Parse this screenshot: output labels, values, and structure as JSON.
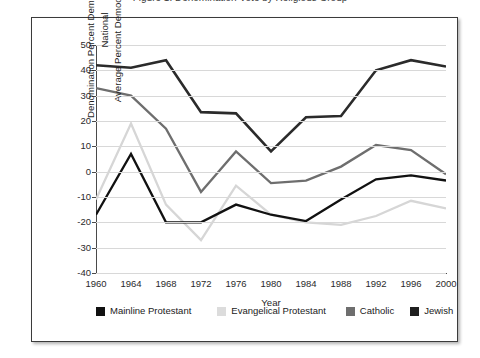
{
  "figure": {
    "title": "Figure 1. Denomination Vote by Religious Group",
    "frame_border_color": "#3b3b3b"
  },
  "chart_data": {
    "type": "line",
    "title": "Figure 1. Denomination Vote by Religious Group",
    "xlabel": "Year",
    "ylabel": "Denomination Percent Democratic Vote –National Average Percent Democratic Vote",
    "ylabel_line1": "Denomination Percent Democratic Vote –National",
    "ylabel_line2": "Average Percent Democratic Vote",
    "x": [
      1960,
      1964,
      1968,
      1972,
      1976,
      1980,
      1984,
      1988,
      1992,
      1996,
      2000
    ],
    "categories": [
      "1960",
      "1964",
      "1968",
      "1972",
      "1976",
      "1980",
      "1984",
      "1988",
      "1992",
      "1996",
      "2000"
    ],
    "ylim": [
      -40,
      50
    ],
    "yticks": [
      50,
      40,
      30,
      20,
      10,
      0,
      -10,
      -20,
      -30,
      -40
    ],
    "ytick_labels": [
      "50",
      "40",
      "30",
      "20",
      "10",
      "0",
      "-10",
      "-20",
      "-30",
      "-40"
    ],
    "grid": true,
    "legend_position": "bottom",
    "series": [
      {
        "name": "Mainline Protestant",
        "color": "#111111",
        "width": 2.3,
        "values": [
          -17,
          7,
          -20,
          -20,
          -13,
          -17,
          -19.5,
          -11,
          -3,
          -1.5,
          -3.5
        ]
      },
      {
        "name": "Evangelical Protestant",
        "color": "#d6d6d6",
        "width": 2.3,
        "values": [
          -11,
          19,
          -13,
          -27,
          -5.5,
          -17,
          -20,
          -21,
          -17.5,
          -11.5,
          -14.5
        ]
      },
      {
        "name": "Catholic",
        "color": "#6e6e6e",
        "width": 2.3,
        "values": [
          33,
          30,
          17,
          -8,
          8,
          -4.5,
          -3.5,
          2,
          10.5,
          8.5,
          -1
        ]
      },
      {
        "name": "Jewish",
        "color": "#2b2b2b",
        "width": 2.6,
        "values": [
          42,
          41,
          44,
          23.5,
          23,
          8,
          21.5,
          22,
          40,
          44,
          41.5
        ]
      }
    ]
  },
  "legend": {
    "items": [
      {
        "label": "Mainline Protestant",
        "color": "#111111"
      },
      {
        "label": "Evangelical Protestant",
        "color": "#dcdcdc"
      },
      {
        "label": "Catholic",
        "color": "#6e6e6e"
      },
      {
        "label": "Jewish",
        "color": "#1f1f1f"
      }
    ]
  }
}
